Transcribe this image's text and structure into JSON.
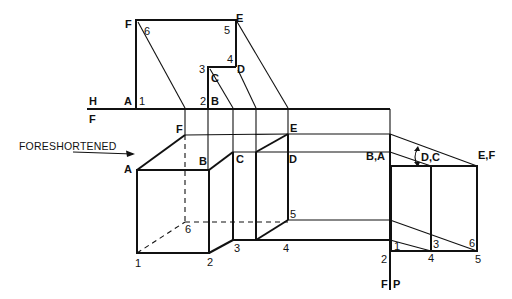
{
  "figure": {
    "fold_line_top": {
      "upper": "H",
      "lower": "F"
    },
    "fold_line_bottom": {
      "left": "F",
      "right": "P"
    },
    "foreshortened_label": "FORESHORTENED",
    "top_view": {
      "letters": [
        "F",
        "E",
        "C",
        "D",
        "A",
        "B"
      ],
      "numbers": [
        "6",
        "5",
        "3",
        "4",
        "1",
        "2"
      ]
    },
    "front_view": {
      "letters": [
        "F",
        "E",
        "A",
        "B",
        "C",
        "D"
      ],
      "numbers": [
        "6",
        "5",
        "1",
        "2",
        "3",
        "4"
      ]
    },
    "profile_view": {
      "letters": [
        "B,A",
        "D,C",
        "E,F"
      ],
      "numbers": [
        "1",
        "2",
        "3",
        "4",
        "5",
        "6"
      ]
    }
  }
}
